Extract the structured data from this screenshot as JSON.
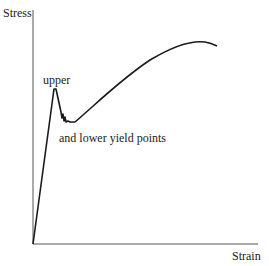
{
  "diagram": {
    "type": "stress-strain curve",
    "y_axis_label": "Stress",
    "x_axis_label": "Strain",
    "annotations": {
      "upper": "upper",
      "lower": "and lower yield points"
    },
    "line_color": "#1a1a1a"
  }
}
